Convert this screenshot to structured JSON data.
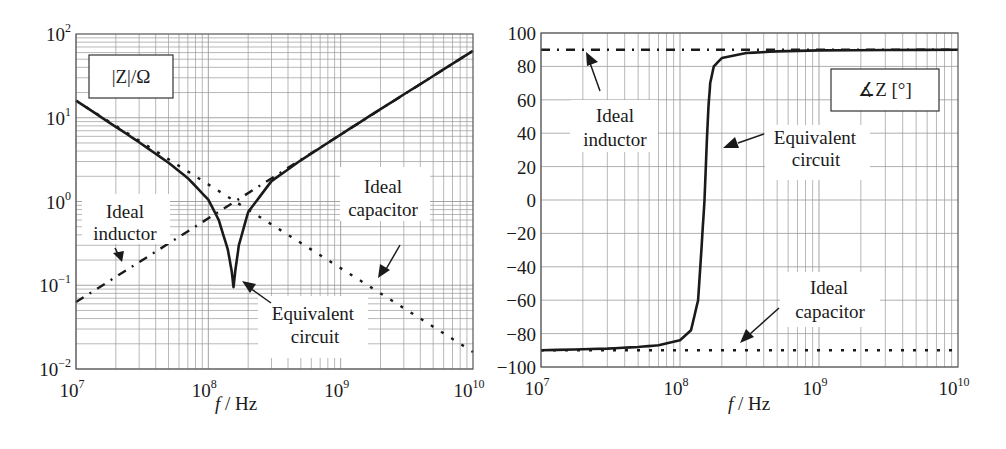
{
  "chart_data": [
    {
      "type": "line",
      "title": "|Z|/Ω",
      "xlabel": "f / Hz",
      "ylabel": "|Z|/Ω",
      "xscale": "log",
      "yscale": "log",
      "xlim": [
        10000000.0,
        10000000000.0
      ],
      "ylim": [
        0.01,
        100
      ],
      "grid": true,
      "x_ticks": [
        {
          "base": "10",
          "exp": "7"
        },
        {
          "base": "10",
          "exp": "8"
        },
        {
          "base": "10",
          "exp": "9"
        },
        {
          "base": "10",
          "exp": "10"
        }
      ],
      "y_ticks": [
        {
          "base": "10",
          "exp": "2"
        },
        {
          "base": "10",
          "exp": "1"
        },
        {
          "base": "10",
          "exp": "0"
        },
        {
          "base": "10",
          "exp": "−1"
        },
        {
          "base": "10",
          "exp": "−2"
        }
      ],
      "series": [
        {
          "name": "Equivalent circuit",
          "style": "solid",
          "x": [
            10000000.0,
            20000000.0,
            30000000.0,
            50000000.0,
            70000000.0,
            100000000.0,
            120000000.0,
            140000000.0,
            150000000.0,
            155000000.0,
            160000000.0,
            170000000.0,
            200000000.0,
            300000000.0,
            500000000.0,
            1000000000.0,
            2000000000.0,
            5000000000.0,
            10000000000.0
          ],
          "y": [
            16,
            7.8,
            5.1,
            2.9,
            1.9,
            1.05,
            0.6,
            0.27,
            0.15,
            0.095,
            0.15,
            0.3,
            0.75,
            1.75,
            3.1,
            6.3,
            12.7,
            31.5,
            63
          ]
        },
        {
          "name": "Ideal inductor",
          "style": "dashdot",
          "x": [
            10000000.0,
            10000000000.0
          ],
          "y": [
            0.063,
            63
          ]
        },
        {
          "name": "Ideal capacitor",
          "style": "dotted",
          "x": [
            10000000.0,
            10000000000.0
          ],
          "y": [
            16,
            0.016
          ]
        }
      ],
      "annotations": [
        {
          "text": [
            "Ideal",
            "inductor"
          ]
        },
        {
          "text": [
            "Ideal",
            "capacitor"
          ]
        },
        {
          "text": [
            "Equivalent",
            "circuit"
          ]
        }
      ]
    },
    {
      "type": "line",
      "title": "∡Z [°]",
      "xlabel": "f / Hz",
      "ylabel": "∡Z [°]",
      "xscale": "log",
      "xlim": [
        10000000.0,
        10000000000.0
      ],
      "ylim": [
        -100,
        100
      ],
      "grid": true,
      "x_ticks": [
        {
          "base": "10",
          "exp": "7"
        },
        {
          "base": "10",
          "exp": "8"
        },
        {
          "base": "10",
          "exp": "9"
        },
        {
          "base": "10",
          "exp": "10"
        }
      ],
      "y_ticks": [
        "100",
        "80",
        "60",
        "40",
        "20",
        "0",
        "−20",
        "−40",
        "−60",
        "−80",
        "−100"
      ],
      "series": [
        {
          "name": "Equivalent circuit",
          "style": "solid",
          "x": [
            10000000.0,
            30000000.0,
            50000000.0,
            70000000.0,
            100000000.0,
            120000000.0,
            135000000.0,
            145000000.0,
            150000000.0,
            155000000.0,
            160000000.0,
            165000000.0,
            175000000.0,
            200000000.0,
            300000000.0,
            500000000.0,
            1000000000.0,
            10000000000.0
          ],
          "y": [
            -90,
            -89,
            -88,
            -87,
            -84,
            -78,
            -60,
            -20,
            0,
            30,
            55,
            70,
            80,
            85,
            88,
            89,
            89.6,
            90
          ]
        },
        {
          "name": "Ideal inductor",
          "style": "dashdot",
          "x": [
            10000000.0,
            10000000000.0
          ],
          "y": [
            90,
            90
          ]
        },
        {
          "name": "Ideal capacitor",
          "style": "dotted",
          "x": [
            10000000.0,
            10000000000.0
          ],
          "y": [
            -90,
            -90
          ]
        }
      ],
      "annotations": [
        {
          "text": [
            "Ideal",
            "inductor"
          ]
        },
        {
          "text": [
            "Equivalent",
            "circuit"
          ]
        },
        {
          "text": [
            "Ideal",
            "capacitor"
          ]
        }
      ]
    }
  ],
  "left": {
    "legend_box": "|Z|/Ω",
    "xlabel_f": "f",
    "xlabel_unit": " / Hz",
    "ann_inductor_1": "Ideal",
    "ann_inductor_2": "inductor",
    "ann_capacitor_1": "Ideal",
    "ann_capacitor_2": "capacitor",
    "ann_equiv_1": "Equivalent",
    "ann_equiv_2": "circuit"
  },
  "right": {
    "legend_box": "∡Z [°]",
    "xlabel_f": "f",
    "xlabel_unit": " / Hz",
    "ann_inductor_1": "Ideal",
    "ann_inductor_2": "inductor",
    "ann_capacitor_1": "Ideal",
    "ann_capacitor_2": "capacitor",
    "ann_equiv_1": "Equivalent",
    "ann_equiv_2": "circuit"
  },
  "colors": {
    "line": "#1a1a1a",
    "grid": "#9a9a9a",
    "frame": "#555555",
    "background": "#ffffff"
  }
}
